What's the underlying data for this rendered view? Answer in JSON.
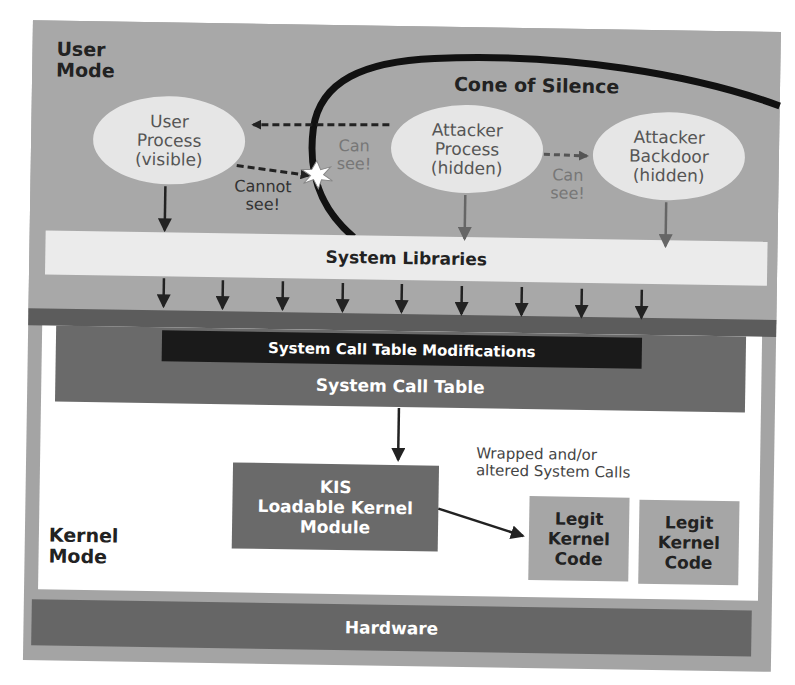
{
  "diagram": {
    "user_mode": {
      "line1": "User",
      "line2": "Mode"
    },
    "kernel_mode": {
      "line1": "Kernel",
      "line2": "Mode"
    },
    "cone_of_silence": {
      "title": "Cone of Silence"
    },
    "processes": [
      {
        "id": "user-process",
        "line1": "User",
        "line2": "Process",
        "line3": "(visible)"
      },
      {
        "id": "attacker-process",
        "line1": "Attacker",
        "line2": "Process",
        "line3": "(hidden)"
      },
      {
        "id": "attacker-backdoor",
        "line1": "Attacker",
        "line2": "Backdoor",
        "line3": "(hidden)"
      }
    ],
    "annotations": {
      "can_see_1": {
        "line1": "Can",
        "line2": "see!"
      },
      "cannot_see": {
        "line1": "Cannot",
        "line2": "see!"
      },
      "can_see_2": {
        "line1": "Can",
        "line2": "see!"
      }
    },
    "system_libraries": "System Libraries",
    "system_call_table_modifications": "System Call Table Modifications",
    "system_call_table": "System Call Table",
    "kis_module": {
      "line1": "KIS",
      "line2": "Loadable Kernel",
      "line3": "Module"
    },
    "wrapped_label": {
      "line1": "Wrapped and/or",
      "line2": "altered System Calls"
    },
    "legit_code": [
      {
        "line1": "Legit",
        "line2": "Kernel",
        "line3": "Code"
      },
      {
        "line1": "Legit",
        "line2": "Kernel",
        "line3": "Code"
      }
    ],
    "hardware": "Hardware",
    "syscall_arrow_count": 9,
    "colors": {
      "user_region": "#a8a8a8",
      "ellipse_fill": "#e6e6e6",
      "dark_band": "#5c5c5c",
      "system_call_table": "#6a6a6a",
      "modifications_bar": "#1a1a1a",
      "legit_box": "#a6a6a6",
      "hardware": "#666666"
    }
  }
}
